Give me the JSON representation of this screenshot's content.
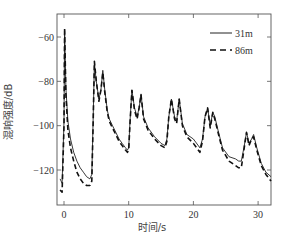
{
  "chart_data": {
    "type": "line",
    "title": "",
    "xlabel": "时间/s",
    "ylabel": "混响强度/dB",
    "xlim": [
      -1,
      32
    ],
    "ylim": [
      -130,
      -52
    ],
    "xticks": [
      0,
      10,
      20,
      30
    ],
    "yticks": [
      -60,
      -80,
      -100,
      -120
    ],
    "grid": false,
    "legend_position": "upper right",
    "series": [
      {
        "name": "31m",
        "style": "solid",
        "color": "#222222",
        "x": [
          -0.6,
          -0.3,
          0.0,
          0.1,
          0.3,
          0.6,
          1.0,
          1.5,
          2.0,
          2.5,
          3.0,
          3.5,
          4.0,
          4.3,
          4.5,
          4.7,
          5.0,
          5.4,
          5.7,
          6.0,
          6.3,
          6.7,
          7.0,
          7.5,
          8.0,
          8.5,
          9.0,
          9.5,
          9.8,
          10.0,
          10.2,
          10.5,
          10.9,
          11.3,
          11.6,
          11.9,
          12.3,
          13.0,
          14.0,
          15.0,
          15.6,
          15.9,
          16.2,
          16.6,
          17.1,
          17.4,
          17.8,
          18.3,
          19.0,
          20.0,
          21.0,
          21.4,
          21.8,
          22.2,
          22.6,
          23.0,
          23.3,
          23.8,
          24.5,
          25.5,
          26.5,
          27.0,
          27.4,
          27.8,
          28.2,
          28.6,
          29.0,
          29.3,
          29.8,
          30.5,
          31.2,
          32.0
        ],
        "y": [
          -124,
          -126,
          -98,
          -57,
          -83,
          -98,
          -106,
          -112,
          -116,
          -119,
          -121,
          -123,
          -124,
          -122,
          -98,
          -72,
          -80,
          -88,
          -84,
          -75,
          -84,
          -93,
          -97,
          -100,
          -103,
          -106,
          -108,
          -110,
          -111,
          -110,
          -98,
          -84,
          -92,
          -96,
          -92,
          -86,
          -96,
          -101,
          -105,
          -108,
          -109,
          -106,
          -96,
          -88,
          -96,
          -98,
          -88,
          -99,
          -104,
          -106,
          -110,
          -106,
          -96,
          -92,
          -100,
          -94,
          -96,
          -102,
          -110,
          -114,
          -115,
          -116,
          -116,
          -110,
          -103,
          -108,
          -106,
          -104,
          -110,
          -117,
          -121,
          -123
        ]
      },
      {
        "name": "86m",
        "style": "dashed",
        "color": "#111111",
        "x": [
          -0.6,
          -0.3,
          0.0,
          0.1,
          0.3,
          0.6,
          1.0,
          1.5,
          2.0,
          2.5,
          3.0,
          3.5,
          4.0,
          4.3,
          4.5,
          4.7,
          5.0,
          5.4,
          5.7,
          6.0,
          6.3,
          6.7,
          7.0,
          7.5,
          8.0,
          8.5,
          9.0,
          9.5,
          9.8,
          10.0,
          10.2,
          10.5,
          10.9,
          11.3,
          11.6,
          11.9,
          12.3,
          13.0,
          14.0,
          15.0,
          15.6,
          15.9,
          16.2,
          16.6,
          17.1,
          17.4,
          17.8,
          18.3,
          19.0,
          20.0,
          21.0,
          21.4,
          21.8,
          22.2,
          22.6,
          23.0,
          23.3,
          23.8,
          24.5,
          25.5,
          26.5,
          27.0,
          27.4,
          27.8,
          28.2,
          28.6,
          29.0,
          29.3,
          29.8,
          30.5,
          31.2,
          32.0
        ],
        "y": [
          -129,
          -130,
          -100,
          -56,
          -86,
          -102,
          -110,
          -116,
          -121,
          -124,
          -126,
          -127,
          -127,
          -125,
          -100,
          -71,
          -80,
          -89,
          -84,
          -76,
          -85,
          -94,
          -98,
          -101,
          -104,
          -107,
          -109,
          -111,
          -112,
          -111,
          -99,
          -84,
          -93,
          -97,
          -92,
          -86,
          -97,
          -102,
          -106,
          -109,
          -110,
          -107,
          -96,
          -88,
          -97,
          -99,
          -88,
          -100,
          -105,
          -108,
          -112,
          -107,
          -96,
          -92,
          -101,
          -94,
          -97,
          -103,
          -111,
          -116,
          -118,
          -119,
          -119,
          -111,
          -103,
          -109,
          -106,
          -105,
          -111,
          -118,
          -122,
          -125
        ]
      }
    ]
  }
}
